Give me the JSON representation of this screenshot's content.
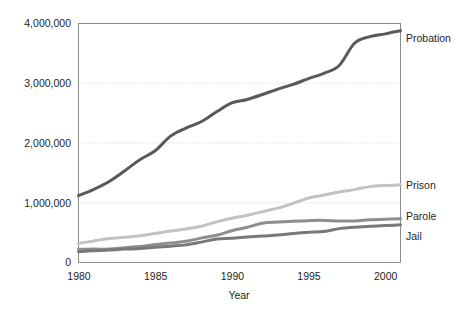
{
  "chart_data": {
    "type": "line",
    "title": "",
    "xlabel": "Year",
    "ylabel": "",
    "xlim": [
      1980,
      2001
    ],
    "ylim": [
      0,
      4000000
    ],
    "grid": true,
    "legend_position": "right-of-plot-at-line-end",
    "x": [
      1980,
      1981,
      1982,
      1983,
      1984,
      1985,
      1986,
      1987,
      1988,
      1989,
      1990,
      1991,
      1992,
      1993,
      1994,
      1995,
      1996,
      1997,
      1998,
      1999,
      2000,
      2001
    ],
    "xticks": [
      "1980",
      "1985",
      "1990",
      "1995",
      "2000"
    ],
    "xtick_values": [
      1980,
      1985,
      1990,
      1995,
      2000
    ],
    "yticks": [
      "0",
      "1,000,000",
      "2,000,000",
      "3,000,000",
      "4,000,000"
    ],
    "ytick_values": [
      0,
      1000000,
      2000000,
      3000000,
      4000000
    ],
    "series": [
      {
        "name": "Probation",
        "color": "#595959",
        "width": 3.0,
        "values": [
          1118000,
          1225000,
          1357000,
          1532000,
          1720000,
          1870000,
          2115000,
          2250000,
          2356000,
          2522000,
          2670000,
          2729000,
          2812000,
          2903000,
          2981000,
          3078000,
          3165000,
          3297000,
          3670000,
          3780000,
          3826000,
          3880000
        ]
      },
      {
        "name": "Prison",
        "color": "#c2c2c2",
        "width": 3.0,
        "values": [
          320000,
          360000,
          402000,
          423000,
          448000,
          487000,
          526000,
          562000,
          607000,
          680000,
          740000,
          790000,
          850000,
          910000,
          990000,
          1080000,
          1130000,
          1180000,
          1220000,
          1270000,
          1290000,
          1300000
        ]
      },
      {
        "name": "Parole",
        "color": "#8e8e8e",
        "width": 3.0,
        "values": [
          220000,
          225000,
          224000,
          246000,
          266000,
          300000,
          325000,
          355000,
          408000,
          456000,
          531000,
          590000,
          658000,
          676000,
          690000,
          700000,
          705000,
          695000,
          696000,
          714000,
          725000,
          732000
        ]
      },
      {
        "name": "Jail",
        "color": "#787878",
        "width": 3.0,
        "values": [
          182000,
          196000,
          209000,
          224000,
          234000,
          256000,
          274000,
          295000,
          341000,
          393000,
          405000,
          426000,
          444000,
          459000,
          486000,
          507000,
          518000,
          567000,
          592000,
          605000,
          621000,
          631000
        ]
      }
    ]
  },
  "axis": {
    "x_title": "Year"
  }
}
